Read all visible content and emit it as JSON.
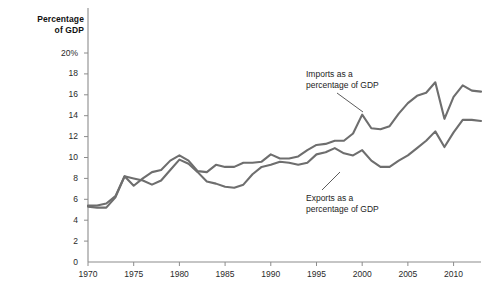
{
  "chart_data": {
    "type": "line",
    "title": "Percentage of GDP",
    "title_line1": "Percentage",
    "title_line2": "of GDP",
    "xlabel": "",
    "ylabel": "Percentage of GDP",
    "xlim": [
      1970,
      2013
    ],
    "ylim": [
      0,
      20
    ],
    "grid": false,
    "legend_position": "inline-annotations",
    "y_ticks": [
      "0",
      "2",
      "4",
      "6",
      "8",
      "10",
      "12",
      "14",
      "16",
      "18",
      "20%"
    ],
    "y_tick_values": [
      0,
      2,
      4,
      6,
      8,
      10,
      12,
      14,
      16,
      18,
      20
    ],
    "x_ticks": [
      "1970",
      "1975",
      "1980",
      "1985",
      "1990",
      "1995",
      "2000",
      "2005",
      "2010"
    ],
    "x_tick_values": [
      1970,
      1975,
      1980,
      1985,
      1990,
      1995,
      2000,
      2005,
      2010
    ],
    "line_color": "#6e6e6e",
    "axis_color": "#8c8c8c",
    "x": [
      1970,
      1971,
      1972,
      1973,
      1974,
      1975,
      1976,
      1977,
      1978,
      1979,
      1980,
      1981,
      1982,
      1983,
      1984,
      1985,
      1986,
      1987,
      1988,
      1989,
      1990,
      1991,
      1992,
      1993,
      1994,
      1995,
      1996,
      1997,
      1998,
      1999,
      2000,
      2001,
      2002,
      2003,
      2004,
      2005,
      2006,
      2007,
      2008,
      2009,
      2010,
      2011,
      2012,
      2013
    ],
    "series": [
      {
        "name": "Imports as a percentage of GDP",
        "label_line1": "Imports as a",
        "label_line2": "percentage of GDP",
        "values": [
          5.4,
          5.4,
          5.6,
          6.3,
          8.2,
          7.3,
          8.0,
          8.6,
          8.8,
          9.7,
          10.2,
          9.7,
          8.7,
          8.6,
          9.3,
          9.1,
          9.1,
          9.5,
          9.5,
          9.6,
          10.3,
          9.9,
          9.9,
          10.1,
          10.7,
          11.2,
          11.3,
          11.6,
          11.6,
          12.3,
          14.1,
          12.8,
          12.7,
          13.0,
          14.2,
          15.2,
          15.9,
          16.2,
          17.2,
          13.7,
          15.8,
          16.9,
          16.4,
          16.3
        ]
      },
      {
        "name": "Exports as a percentage of GDP",
        "label_line1": "Exports as a",
        "label_line2": "percentage of GDP",
        "values": [
          5.3,
          5.2,
          5.2,
          6.2,
          8.2,
          8.0,
          7.8,
          7.4,
          7.8,
          8.8,
          9.8,
          9.4,
          8.6,
          7.7,
          7.5,
          7.2,
          7.1,
          7.4,
          8.4,
          9.1,
          9.3,
          9.6,
          9.5,
          9.3,
          9.5,
          10.3,
          10.5,
          10.9,
          10.4,
          10.2,
          10.7,
          9.7,
          9.1,
          9.1,
          9.7,
          10.2,
          10.9,
          11.6,
          12.5,
          11.0,
          12.4,
          13.6,
          13.6,
          13.5
        ]
      }
    ]
  }
}
